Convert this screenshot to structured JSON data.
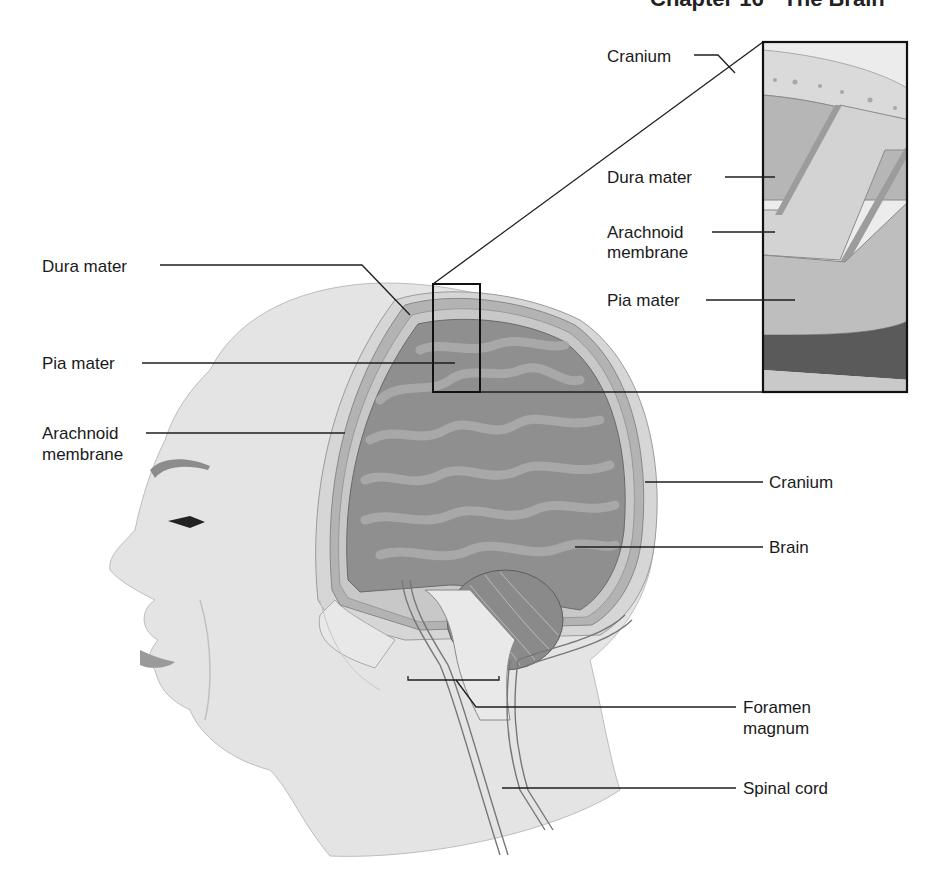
{
  "header": {
    "running_title": "Chapter 16 · The Brain"
  },
  "figure": {
    "inset_labels": [
      {
        "id": "inset-cranium",
        "text": "Cranium"
      },
      {
        "id": "inset-dura-mater",
        "text": "Dura mater"
      },
      {
        "id": "inset-arachnoid-line1",
        "text": "Arachnoid"
      },
      {
        "id": "inset-arachnoid-line2",
        "text": "membrane"
      },
      {
        "id": "inset-pia-mater",
        "text": "Pia mater"
      }
    ],
    "left_labels": [
      {
        "id": "dura-mater",
        "text": "Dura mater"
      },
      {
        "id": "pia-mater",
        "text": "Pia mater"
      },
      {
        "id": "arachnoid-line1",
        "text": "Arachnoid"
      },
      {
        "id": "arachnoid-line2",
        "text": "membrane"
      }
    ],
    "right_labels": [
      {
        "id": "cranium",
        "text": "Cranium"
      },
      {
        "id": "brain",
        "text": "Brain"
      },
      {
        "id": "foramen-line1",
        "text": "Foramen"
      },
      {
        "id": "foramen-line2",
        "text": "magnum"
      },
      {
        "id": "spinal-cord",
        "text": "Spinal cord"
      }
    ]
  },
  "colors": {
    "skin": "#e2e2e2",
    "skin_shadow": "#cfcfcf",
    "bone": "#d8d8d8",
    "dura": "#a9a9a9",
    "arachnoid": "#c4c4c4",
    "brain": "#8e8e8e",
    "brain_fold": "#a8a8a8",
    "cerebellum": "#8a8a8a",
    "lines": "#1e1e1e"
  }
}
